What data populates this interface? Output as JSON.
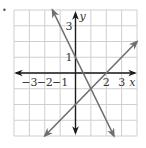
{
  "bullet": "•",
  "chart_data": {
    "type": "line",
    "title": "",
    "xlabel": "x",
    "ylabel": "y",
    "xlim": [
      -4,
      4
    ],
    "ylim": [
      -4,
      4
    ],
    "grid": true,
    "x_tick_labels": [
      "−3",
      "−2",
      "−1",
      "2",
      "3"
    ],
    "x_ticks": [
      -3,
      -2,
      -1,
      2,
      3
    ],
    "y_tick_labels": [
      "3",
      "1"
    ],
    "y_ticks": [
      3,
      1
    ],
    "series": [
      {
        "name": "y = -2x + 1",
        "x": [
          -1.5,
          2.5
        ],
        "y": [
          4,
          -4
        ],
        "color": "#6e6e6e"
      },
      {
        "name": "y = x - 2",
        "x": [
          -2,
          4
        ],
        "y": [
          -4,
          2
        ],
        "color": "#6e6e6e"
      }
    ],
    "intersection": {
      "x": 1,
      "y": -1
    }
  },
  "colors": {
    "grid": "#cfcfcf",
    "axis": "#1a1a1a",
    "line": "#6e6e6e"
  }
}
